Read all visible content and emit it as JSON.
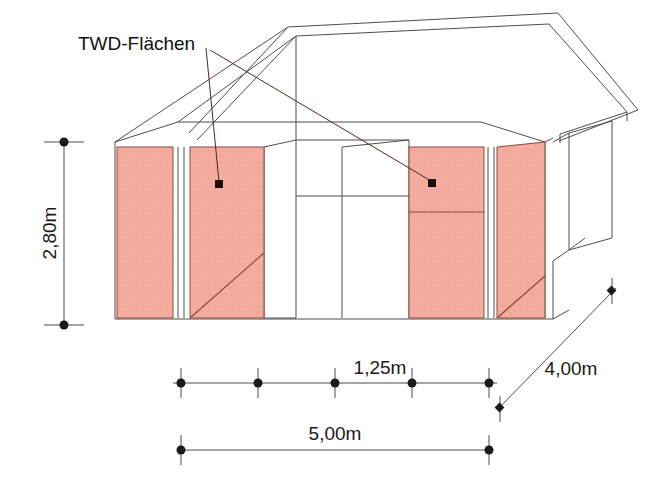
{
  "drawing": {
    "title_label": "TWD-Flächen",
    "colors": {
      "panel_fill": "#f3ab9d",
      "panel_stroke": "#8c4a3c",
      "line": "#4d4d4d",
      "text": "#1a1a1a",
      "marker": "#1a0d0a",
      "background": "#ffffff"
    },
    "dimensions": {
      "height": "2,80m",
      "module": "1,25m",
      "width": "5,00m",
      "depth": "4,00m"
    },
    "panels": [
      {
        "name": "twd-panel-1",
        "hatch": "none"
      },
      {
        "name": "twd-panel-2",
        "hatch": "diagonal"
      },
      {
        "name": "twd-panel-3",
        "hatch": "horizontal"
      },
      {
        "name": "twd-panel-4",
        "hatch": "diagonal"
      }
    ],
    "markers": [
      {
        "name": "leader-marker-left"
      },
      {
        "name": "leader-marker-right"
      }
    ]
  }
}
